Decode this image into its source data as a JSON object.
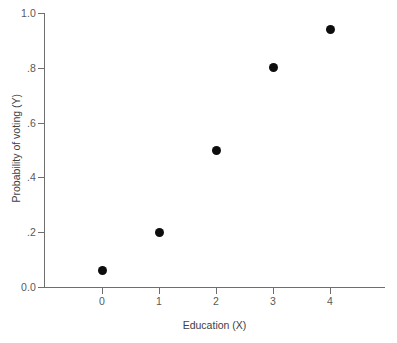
{
  "chart_data": {
    "type": "scatter",
    "title": "",
    "xlabel": "Education (X)",
    "ylabel": "Probability of voting (Y)",
    "x": [
      0,
      1,
      2,
      3,
      4
    ],
    "values": [
      0.06,
      0.2,
      0.5,
      0.8,
      0.94
    ],
    "xlim": [
      -0.9,
      5.0
    ],
    "ylim": [
      0.0,
      1.0
    ],
    "xticks": [
      "0",
      "1",
      "2",
      "3",
      "4"
    ],
    "yticks": [
      "0.0",
      ".2",
      ".4",
      ".6",
      ".8",
      "1.0"
    ],
    "ytick_values": [
      0.0,
      0.2,
      0.4,
      0.6,
      0.8,
      1.0
    ],
    "grid": false,
    "legend": null,
    "marker": "filled-circle",
    "marker_color": "#0d0d0d",
    "axis_color": "#6e6e6e",
    "text_color": "#58595b",
    "background": "#ffffff"
  }
}
